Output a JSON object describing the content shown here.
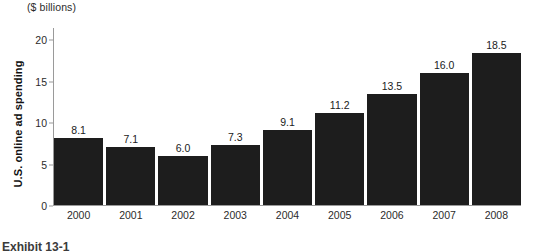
{
  "chart_data": {
    "type": "bar",
    "title": "",
    "unit_header": "($ billions)",
    "xlabel": "",
    "ylabel": "U.S. online ad spending",
    "categories": [
      "2000",
      "2001",
      "2002",
      "2003",
      "2004",
      "2005",
      "2006",
      "2007",
      "2008"
    ],
    "values": [
      8.1,
      7.1,
      6.0,
      7.3,
      9.1,
      11.2,
      13.5,
      16.0,
      18.5
    ],
    "value_labels": [
      "8.1",
      "7.1",
      "6.0",
      "7.3",
      "9.1",
      "11.2",
      "13.5",
      "16.0",
      "18.5"
    ],
    "ylim": [
      0,
      21.5
    ],
    "yticks": [
      0,
      5,
      10,
      15,
      20
    ],
    "ytick_labels": [
      "0",
      "5",
      "10",
      "15",
      "20"
    ],
    "grid": false,
    "legend": null,
    "bar_color": "#1d1d1d",
    "axis_color": "#9a9a9a",
    "text_color": "#2b2b2b"
  },
  "caption": {
    "text": "Exhibit 13-1"
  }
}
